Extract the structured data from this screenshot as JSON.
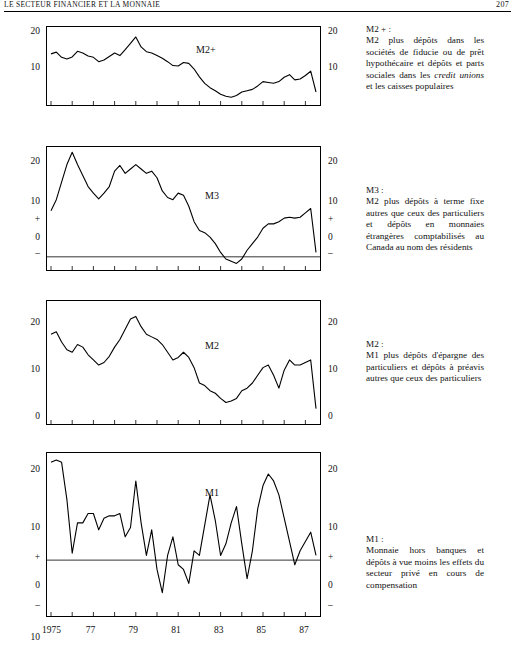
{
  "runhead": {
    "left": "LE SECTEUR FINANCIER ET LA MONNAIE",
    "right": "207"
  },
  "xaxis": {
    "ticks": [
      {
        "label": "1975",
        "year": 1975
      },
      {
        "label": "77",
        "year": 1977
      },
      {
        "label": "79",
        "year": 1979
      },
      {
        "label": "81",
        "year": 1981
      },
      {
        "label": "83",
        "year": 1983
      },
      {
        "label": "85",
        "year": 1985
      },
      {
        "label": "87",
        "year": 1987
      }
    ]
  },
  "panels": [
    {
      "id": "m2plus",
      "series_label": "M2+",
      "yticks_left": [
        "20",
        "10"
      ],
      "yticks_right": [
        "20",
        "10"
      ],
      "note_title": "M2 + :",
      "note_body_1": "M2 plus dépôts dans les sociétés de fiducie ou de prêt hypothécaire et dépôts et parts sociales dans les ",
      "note_italic": "credit unions",
      "note_body_2": " et les caisses populaires"
    },
    {
      "id": "m3",
      "series_label": "M3",
      "yticks_left": [
        "20",
        "10",
        "+",
        "0",
        "–"
      ],
      "yticks_right": [
        "20",
        "10",
        "+",
        "0",
        "–"
      ],
      "note_title": "M3 :",
      "note_body_1": "M2 plus dépôts à terme fixe autres que ceux des particuliers et dépôts en monnaies étrangères comptabilisés au Canada au nom des résidents",
      "note_italic": "",
      "note_body_2": ""
    },
    {
      "id": "m2",
      "series_label": "M2",
      "yticks_left": [
        "20",
        "10",
        "0"
      ],
      "yticks_right": [
        "20",
        "10",
        "0"
      ],
      "note_title": "M2 :",
      "note_body_1": "M1 plus dépôts d'épargne des particuliers et dépôts à préavis autres que ceux des particuliers",
      "note_italic": "",
      "note_body_2": ""
    },
    {
      "id": "m1",
      "series_label": "M1",
      "yticks_left": [
        "20",
        "10",
        "+",
        "0",
        "–",
        "10"
      ],
      "yticks_right": [
        "20",
        "10",
        "+",
        "0",
        "–"
      ],
      "note_title": "M1 :",
      "note_body_1": "Monnaie hors banques et dépôts à vue moins les effets du secteur privé en cours de compensation",
      "note_italic": "",
      "note_body_2": ""
    }
  ],
  "chart_data": [
    {
      "type": "line",
      "title": "M2+",
      "xlabel": "",
      "ylabel": "",
      "ylim": [
        4,
        22
      ],
      "yticks": [
        10,
        20
      ],
      "grid": false,
      "x": [
        1975.0,
        1975.25,
        1975.5,
        1975.75,
        1976.0,
        1976.25,
        1976.5,
        1976.75,
        1977.0,
        1977.25,
        1977.5,
        1977.75,
        1978.0,
        1978.25,
        1978.5,
        1978.75,
        1979.0,
        1979.25,
        1979.5,
        1979.75,
        1980.0,
        1980.25,
        1980.5,
        1980.75,
        1981.0,
        1981.25,
        1981.5,
        1981.75,
        1982.0,
        1982.25,
        1982.5,
        1982.75,
        1983.0,
        1983.25,
        1983.5,
        1983.75,
        1984.0,
        1984.25,
        1984.5,
        1984.75,
        1985.0,
        1985.25,
        1985.5,
        1985.75,
        1986.0,
        1986.25,
        1986.5,
        1986.75,
        1987.0,
        1987.25,
        1987.5
      ],
      "y": [
        15.8,
        16.2,
        15.0,
        14.6,
        15.1,
        16.4,
        16.0,
        15.3,
        15.0,
        14.0,
        14.4,
        15.2,
        16.0,
        15.4,
        16.8,
        18.2,
        19.7,
        17.4,
        16.3,
        16.0,
        15.4,
        14.8,
        14.0,
        13.1,
        13.0,
        13.8,
        13.6,
        12.3,
        10.5,
        9.0,
        8.0,
        7.3,
        6.5,
        6.0,
        5.8,
        6.2,
        7.0,
        7.3,
        7.6,
        8.4,
        9.4,
        9.2,
        9.0,
        9.4,
        10.4,
        11.0,
        9.8,
        10.0,
        10.8,
        11.8,
        7.0
      ]
    },
    {
      "type": "line",
      "title": "M3",
      "xlabel": "",
      "ylabel": "",
      "ylim": [
        -3,
        25
      ],
      "yticks": [
        0,
        10,
        20
      ],
      "grid": false,
      "zeroline": true,
      "x": [
        1975.0,
        1975.25,
        1975.5,
        1975.75,
        1976.0,
        1976.25,
        1976.5,
        1976.75,
        1977.0,
        1977.25,
        1977.5,
        1977.75,
        1978.0,
        1978.25,
        1978.5,
        1978.75,
        1979.0,
        1979.25,
        1979.5,
        1979.75,
        1980.0,
        1980.25,
        1980.5,
        1980.75,
        1981.0,
        1981.25,
        1981.5,
        1981.75,
        1982.0,
        1982.25,
        1982.5,
        1982.75,
        1983.0,
        1983.25,
        1983.5,
        1983.75,
        1984.0,
        1984.25,
        1984.5,
        1984.75,
        1985.0,
        1985.25,
        1985.5,
        1985.75,
        1986.0,
        1986.25,
        1986.5,
        1986.75,
        1987.0,
        1987.25,
        1987.5
      ],
      "y": [
        10.5,
        13.0,
        17.0,
        21.0,
        23.8,
        21.0,
        18.5,
        16.0,
        14.5,
        13.2,
        14.5,
        16.0,
        19.5,
        20.8,
        19.0,
        20.0,
        21.0,
        20.0,
        19.0,
        19.5,
        18.0,
        15.0,
        13.5,
        13.0,
        14.5,
        14.0,
        11.5,
        8.0,
        6.0,
        5.5,
        4.5,
        3.0,
        1.0,
        -0.5,
        -1.0,
        -1.5,
        -0.5,
        1.5,
        3.0,
        4.5,
        6.5,
        7.5,
        7.5,
        8.0,
        8.8,
        9.0,
        8.8,
        9.0,
        10.0,
        11.0,
        1.0
      ]
    },
    {
      "type": "line",
      "title": "M2",
      "xlabel": "",
      "ylabel": "",
      "ylim": [
        0,
        24
      ],
      "yticks": [
        0,
        10,
        20
      ],
      "grid": false,
      "x": [
        1975.0,
        1975.25,
        1975.5,
        1975.75,
        1976.0,
        1976.25,
        1976.5,
        1976.75,
        1977.0,
        1977.25,
        1977.5,
        1977.75,
        1978.0,
        1978.25,
        1978.5,
        1978.75,
        1979.0,
        1979.25,
        1979.5,
        1979.75,
        1980.0,
        1980.25,
        1980.5,
        1980.75,
        1981.0,
        1981.25,
        1981.5,
        1981.75,
        1982.0,
        1982.25,
        1982.5,
        1982.75,
        1983.0,
        1983.25,
        1983.5,
        1983.75,
        1984.0,
        1984.25,
        1984.5,
        1984.75,
        1985.0,
        1985.25,
        1985.5,
        1985.75,
        1986.0,
        1986.25,
        1986.5,
        1986.75,
        1987.0,
        1987.25,
        1987.5
      ],
      "y": [
        17.5,
        18.0,
        16.0,
        14.5,
        14.0,
        15.5,
        15.0,
        13.5,
        12.5,
        11.5,
        12.0,
        13.2,
        15.0,
        16.5,
        18.5,
        20.5,
        21.0,
        19.0,
        17.5,
        17.0,
        16.5,
        15.5,
        14.0,
        12.5,
        13.0,
        14.0,
        13.0,
        11.0,
        8.0,
        7.5,
        6.5,
        6.0,
        5.0,
        4.2,
        4.5,
        5.0,
        6.5,
        7.0,
        8.0,
        9.5,
        11.0,
        11.5,
        9.5,
        7.0,
        10.5,
        12.5,
        11.5,
        11.5,
        12.0,
        12.5,
        3.0
      ]
    },
    {
      "type": "line",
      "title": "M1",
      "xlabel": "",
      "ylabel": "",
      "ylim": [
        -12,
        23
      ],
      "yticks": [
        -10,
        0,
        10,
        20
      ],
      "grid": false,
      "zeroline": true,
      "x": [
        1975.0,
        1975.25,
        1975.5,
        1975.75,
        1976.0,
        1976.25,
        1976.5,
        1976.75,
        1977.0,
        1977.25,
        1977.5,
        1977.75,
        1978.0,
        1978.25,
        1978.5,
        1978.75,
        1979.0,
        1979.25,
        1979.5,
        1979.75,
        1980.0,
        1980.25,
        1980.5,
        1980.75,
        1981.0,
        1981.25,
        1981.5,
        1981.75,
        1982.0,
        1982.25,
        1982.5,
        1982.75,
        1983.0,
        1983.25,
        1983.5,
        1983.75,
        1984.0,
        1984.25,
        1984.5,
        1984.75,
        1985.0,
        1985.25,
        1985.5,
        1985.75,
        1986.0,
        1986.25,
        1986.5,
        1986.75,
        1987.0,
        1987.25,
        1987.5
      ],
      "y": [
        21.0,
        21.5,
        21.0,
        13.0,
        1.5,
        8.0,
        8.0,
        10.0,
        10.0,
        6.5,
        9.0,
        9.5,
        9.5,
        10.0,
        5.0,
        7.0,
        17.0,
        8.0,
        1.0,
        6.5,
        -2.0,
        -7.0,
        1.0,
        5.0,
        -1.0,
        -2.0,
        -5.0,
        2.0,
        1.0,
        7.5,
        14.0,
        8.5,
        1.0,
        3.5,
        8.0,
        11.5,
        3.5,
        -4.0,
        2.0,
        11.0,
        16.0,
        18.5,
        17.0,
        14.0,
        9.0,
        4.0,
        -1.0,
        2.0,
        4.0,
        6.0,
        1.0
      ]
    }
  ]
}
